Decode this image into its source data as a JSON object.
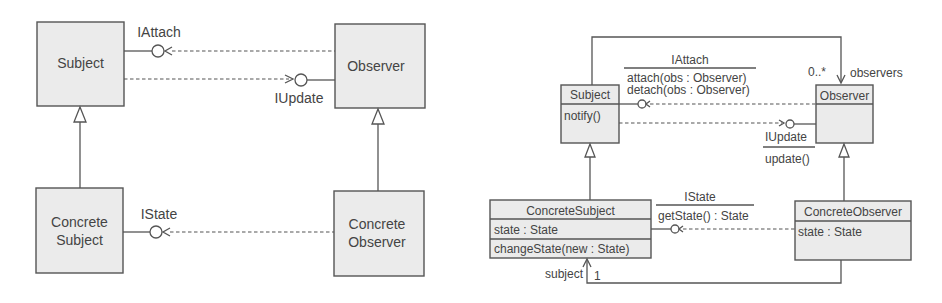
{
  "left_diagram": {
    "classes": {
      "subject": "Subject",
      "observer": "Observer",
      "concrete_subject": [
        "Concrete",
        "Subject"
      ],
      "concrete_observer": [
        "Concrete",
        "Observer"
      ]
    },
    "interfaces": {
      "attach": "IAttach",
      "update": "IUpdate",
      "state": "IState"
    }
  },
  "right_diagram": {
    "subject": {
      "name": "Subject",
      "operations": [
        "notify()"
      ]
    },
    "observer": {
      "name": "Observer",
      "operations": []
    },
    "concrete_subject": {
      "name": "ConcreteSubject",
      "attributes": [
        "state : State"
      ],
      "operations": [
        "changeState(new : State)"
      ]
    },
    "concrete_observer": {
      "name": "ConcreteObserver",
      "attributes": [
        "state : State"
      ]
    },
    "interfaces": {
      "attach": {
        "name": "IAttach",
        "operations": [
          "attach(obs : Observer)",
          "detach(obs : Observer)"
        ]
      },
      "update": {
        "name": "IUpdate",
        "operations": [
          "update()"
        ]
      },
      "state": {
        "name": "IState",
        "operations": [
          "getState() : State"
        ]
      }
    },
    "associations": {
      "observers": {
        "multiplicity": "0..*",
        "role": "observers"
      },
      "subject": {
        "multiplicity": "1",
        "role": "subject"
      }
    }
  }
}
